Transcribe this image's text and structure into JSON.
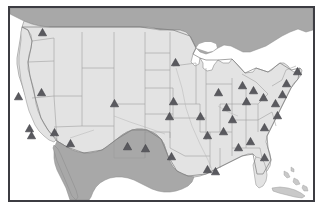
{
  "map": {
    "title": "United States Location Map",
    "projection_note": "continental united states",
    "frame": {
      "border_color": "#3c3c42",
      "border_width_px": 2,
      "background_color": "#ffffff"
    },
    "colors": {
      "us_land": "#e3e3e3",
      "us_land_alt": "#dcdcdc",
      "state_border": "#9a9a9a",
      "country_border": "#8a8a8a",
      "canada_land": "#a8a8a8",
      "mexico_land": "#a8a8a8",
      "caribbean_land": "#c9c9c9",
      "water": "#ffffff",
      "great_lakes": "#ffffff",
      "marker_fill": "#5a5a5f",
      "marker_stroke": "#3a3a3f"
    },
    "regions": [
      {
        "name": "canada",
        "label": "Canada",
        "fill_key": "canada_land"
      },
      {
        "name": "mexico",
        "label": "Mexico",
        "fill_key": "mexico_land"
      },
      {
        "name": "united-states",
        "label": "United States",
        "fill_key": "us_land"
      },
      {
        "name": "cuba",
        "label": "Cuba",
        "fill_key": "caribbean_land"
      },
      {
        "name": "bahamas",
        "label": "Bahamas",
        "fill_key": "caribbean_land"
      }
    ],
    "marker_symbol": "triangle-up",
    "marker_count": 35,
    "marker_size_px": 9,
    "markers": [
      {
        "id": "m01",
        "label": "Seattle WA",
        "x": 32,
        "y": 28
      },
      {
        "id": "m02",
        "label": "Boise ID",
        "x": 31,
        "y": 88
      },
      {
        "id": "m03",
        "label": "San Francisco CA",
        "x": 8,
        "y": 92
      },
      {
        "id": "m04",
        "label": "Los Angeles CA",
        "x": 20,
        "y": 124
      },
      {
        "id": "m05",
        "label": "San Diego CA",
        "x": 21,
        "y": 131
      },
      {
        "id": "m06",
        "label": "Las Vegas NV",
        "x": 44,
        "y": 128
      },
      {
        "id": "m07",
        "label": "Phoenix AZ",
        "x": 60,
        "y": 139
      },
      {
        "id": "m08",
        "label": "Salt Lake City UT",
        "x": 104,
        "y": 99
      },
      {
        "id": "m09",
        "label": "Denver CO",
        "x": 117,
        "y": 142
      },
      {
        "id": "m10",
        "label": "Albuquerque NM",
        "x": 135,
        "y": 144
      },
      {
        "id": "m11",
        "label": "Minneapolis MN",
        "x": 165,
        "y": 58
      },
      {
        "id": "m12",
        "label": "Des Moines IA",
        "x": 163,
        "y": 97
      },
      {
        "id": "m13",
        "label": "Kansas City MO",
        "x": 159,
        "y": 112
      },
      {
        "id": "m14",
        "label": "Dallas TX",
        "x": 161,
        "y": 152
      },
      {
        "id": "m15",
        "label": "Houston TX",
        "x": 197,
        "y": 165
      },
      {
        "id": "m16",
        "label": "St Louis MO",
        "x": 190,
        "y": 112
      },
      {
        "id": "m17",
        "label": "Chicago IL",
        "x": 208,
        "y": 88
      },
      {
        "id": "m18",
        "label": "Indianapolis IN",
        "x": 216,
        "y": 103
      },
      {
        "id": "m19",
        "label": "Louisville KY",
        "x": 222,
        "y": 115
      },
      {
        "id": "m20",
        "label": "Nashville TN",
        "x": 213,
        "y": 127
      },
      {
        "id": "m21",
        "label": "Memphis TN",
        "x": 197,
        "y": 131
      },
      {
        "id": "m22",
        "label": "New Orleans LA",
        "x": 205,
        "y": 167
      },
      {
        "id": "m23",
        "label": "Birmingham AL",
        "x": 228,
        "y": 143
      },
      {
        "id": "m24",
        "label": "Atlanta GA",
        "x": 240,
        "y": 137
      },
      {
        "id": "m25",
        "label": "Detroit MI",
        "x": 232,
        "y": 81
      },
      {
        "id": "m26",
        "label": "Cleveland OH",
        "x": 243,
        "y": 86
      },
      {
        "id": "m27",
        "label": "Columbus OH",
        "x": 236,
        "y": 97
      },
      {
        "id": "m28",
        "label": "Pittsburgh PA",
        "x": 253,
        "y": 93
      },
      {
        "id": "m29",
        "label": "Charlotte NC",
        "x": 254,
        "y": 123
      },
      {
        "id": "m30",
        "label": "Jacksonville FL",
        "x": 254,
        "y": 153
      },
      {
        "id": "m31",
        "label": "Washington DC",
        "x": 265,
        "y": 99
      },
      {
        "id": "m32",
        "label": "Philadelphia PA",
        "x": 272,
        "y": 90
      },
      {
        "id": "m33",
        "label": "New York NY",
        "x": 276,
        "y": 79
      },
      {
        "id": "m34",
        "label": "Boston MA",
        "x": 287,
        "y": 67
      },
      {
        "id": "m35",
        "label": "Richmond VA",
        "x": 267,
        "y": 111
      }
    ]
  }
}
